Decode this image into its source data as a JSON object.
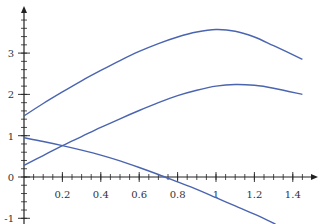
{
  "chart_data": {
    "type": "line",
    "title": "",
    "xlabel": "",
    "ylabel": "",
    "xlim": [
      0,
      1.5
    ],
    "ylim": [
      -1.15,
      3.9
    ],
    "grid": false,
    "legend": null,
    "x_ticks": [
      0.2,
      0.4,
      0.6,
      0.8,
      1,
      1.2,
      1.4
    ],
    "x_tick_labels": [
      "0.2",
      "0.4",
      "0.6",
      "0.8",
      "1",
      "1.2",
      "1.4"
    ],
    "x_minor_step": 0.05,
    "y_ticks": [
      -1,
      0,
      1,
      2,
      3
    ],
    "y_tick_labels": [
      "-1",
      "0",
      "1",
      "2",
      "3"
    ],
    "y_minor_step": 0.2,
    "series": [
      {
        "name": "curve-upper",
        "color": "#4a64b0",
        "x": [
          0,
          0.1,
          0.2,
          0.3,
          0.4,
          0.5,
          0.6,
          0.7,
          0.8,
          0.9,
          1.0,
          1.1,
          1.2,
          1.3,
          1.45
        ],
        "y": [
          1.48,
          1.78,
          2.06,
          2.33,
          2.58,
          2.82,
          3.04,
          3.23,
          3.39,
          3.51,
          3.57,
          3.53,
          3.39,
          3.18,
          2.85
        ]
      },
      {
        "name": "curve-middle",
        "color": "#4a64b0",
        "x": [
          0,
          0.1,
          0.2,
          0.3,
          0.4,
          0.5,
          0.6,
          0.7,
          0.8,
          0.9,
          1.0,
          1.1,
          1.2,
          1.3,
          1.45
        ],
        "y": [
          0.28,
          0.52,
          0.76,
          0.98,
          1.2,
          1.41,
          1.61,
          1.8,
          1.97,
          2.1,
          2.2,
          2.24,
          2.22,
          2.15,
          2.0
        ]
      },
      {
        "name": "curve-descending",
        "color": "#4a64b0",
        "x": [
          0,
          0.1,
          0.2,
          0.3,
          0.4,
          0.5,
          0.6,
          0.7,
          0.8,
          0.9,
          1.0,
          1.1,
          1.2,
          1.31
        ],
        "y": [
          0.95,
          0.86,
          0.76,
          0.65,
          0.53,
          0.39,
          0.23,
          0.06,
          -0.12,
          -0.3,
          -0.5,
          -0.7,
          -0.9,
          -1.14
        ]
      }
    ]
  },
  "axis_color": "#222222",
  "label_color": "#333333"
}
